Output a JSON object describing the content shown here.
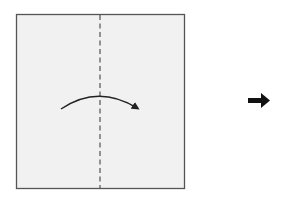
{
  "diagram": {
    "type": "folding-instruction",
    "step_description": "Fold the square in half along the vertical center line, left to right",
    "paper": {
      "shape": "square",
      "fill": "#f1f1f1",
      "border": "#555555",
      "x": 16,
      "y": 14,
      "width": 168,
      "height": 174
    },
    "fold_line": {
      "style": "dashed",
      "orientation": "vertical",
      "x": 100,
      "color": "#444444"
    },
    "fold_arrow": {
      "direction": "left-to-right",
      "shape": "curved",
      "color": "#222222"
    },
    "next_step_arrow": {
      "icon": "right-arrow-icon",
      "color": "#111111"
    }
  }
}
